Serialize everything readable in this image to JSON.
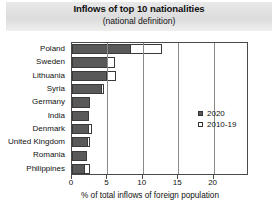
{
  "chart_data": {
    "type": "bar",
    "orientation": "horizontal",
    "title": "Inflows of top 10 nationalities",
    "subtitle": "(national definition)",
    "xlabel": "% of total inflows of foreign population",
    "ylabel": "",
    "xlim": [
      0,
      25
    ],
    "xticks": [
      0,
      5,
      10,
      15,
      20
    ],
    "xtick_labels": [
      "0",
      "5",
      "10",
      "15",
      "20"
    ],
    "grid": true,
    "legend_position": "center-right",
    "categories": [
      "Poland",
      "Sweden",
      "Lithuania",
      "Syria",
      "Germany",
      "India",
      "Denmark",
      "United Kingdom",
      "Romania",
      "Philippines"
    ],
    "series": [
      {
        "name": "2020",
        "color": "#595959",
        "values": [
          8.4,
          5.1,
          4.9,
          4.3,
          2.5,
          2.4,
          2.4,
          2.2,
          2.1,
          1.8
        ]
      },
      {
        "name": "2010-19",
        "color": "#ffffff",
        "values": [
          12.7,
          6.1,
          6.2,
          4.5,
          2.0,
          1.7,
          2.8,
          2.6,
          1.7,
          2.5
        ]
      }
    ],
    "legend": [
      {
        "label": "2020",
        "swatch": "dark"
      },
      {
        "label": "2010-19",
        "swatch": "light"
      }
    ]
  }
}
